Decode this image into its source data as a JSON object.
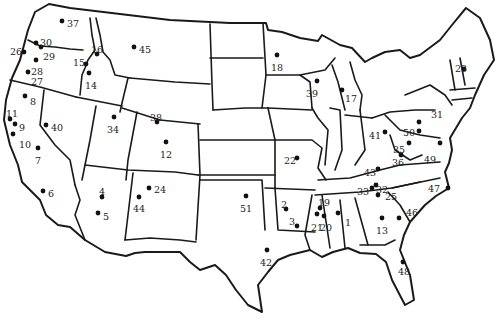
{
  "map": {
    "region": "Contiguous United States",
    "type": "point-location map with numbered sites",
    "colors": {
      "background": "#ffffff",
      "border": "#1a1a1a",
      "marker": "#111111",
      "label": "#222222"
    }
  },
  "sites": [
    {
      "id": "1",
      "x": 338,
      "y": 213,
      "lx": 345,
      "ly": 223
    },
    {
      "id": "2",
      "x": 286,
      "y": 209,
      "lx": 281,
      "ly": 205
    },
    {
      "id": "3",
      "x": 297,
      "y": 226,
      "lx": 289,
      "ly": 222
    },
    {
      "id": "4",
      "x": 102,
      "y": 197,
      "lx": 99,
      "ly": 192
    },
    {
      "id": "5",
      "x": 98,
      "y": 213,
      "lx": 103,
      "ly": 217
    },
    {
      "id": "6",
      "x": 43,
      "y": 191,
      "lx": 48,
      "ly": 194
    },
    {
      "id": "7",
      "x": 38,
      "y": 148,
      "lx": 35,
      "ly": 161
    },
    {
      "id": "8",
      "x": 25,
      "y": 96,
      "lx": 30,
      "ly": 102
    },
    {
      "id": "9",
      "x": 15,
      "y": 124,
      "lx": 19,
      "ly": 128
    },
    {
      "id": "10",
      "x": 13,
      "y": 134,
      "lx": 19,
      "ly": 145
    },
    {
      "id": "11",
      "x": 10,
      "y": 119,
      "lx": 6,
      "ly": 114
    },
    {
      "id": "12",
      "x": 166,
      "y": 142,
      "lx": 160,
      "ly": 155
    },
    {
      "id": "13",
      "x": 382,
      "y": 218,
      "lx": 376,
      "ly": 231
    },
    {
      "id": "14",
      "x": 89,
      "y": 73,
      "lx": 85,
      "ly": 86
    },
    {
      "id": "15",
      "x": 86,
      "y": 64,
      "lx": 73,
      "ly": 63
    },
    {
      "id": "16",
      "x": 97,
      "y": 54,
      "lx": 91,
      "ly": 50
    },
    {
      "id": "17",
      "x": 342,
      "y": 90,
      "lx": 345,
      "ly": 99
    },
    {
      "id": "18",
      "x": 277,
      "y": 55,
      "lx": 271,
      "ly": 68
    },
    {
      "id": "19",
      "x": 320,
      "y": 208,
      "lx": 318,
      "ly": 203
    },
    {
      "id": "20",
      "x": 324,
      "y": 216,
      "lx": 320,
      "ly": 228
    },
    {
      "id": "21",
      "x": 317,
      "y": 214,
      "lx": 311,
      "ly": 228
    },
    {
      "id": "22",
      "x": 297,
      "y": 158,
      "lx": 284,
      "ly": 161
    },
    {
      "id": "23",
      "x": 464,
      "y": 69,
      "lx": 455,
      "ly": 69
    },
    {
      "id": "24",
      "x": 149,
      "y": 188,
      "lx": 154,
      "ly": 190
    },
    {
      "id": "25",
      "x": 378,
      "y": 195,
      "lx": 385,
      "ly": 197
    },
    {
      "id": "26",
      "x": 24,
      "y": 52,
      "lx": 10,
      "ly": 52
    },
    {
      "id": "27",
      "x": 28,
      "y": 72,
      "lx": 31,
      "ly": 82
    },
    {
      "id": "28",
      "x": 36,
      "y": 60,
      "lx": 31,
      "ly": 72
    },
    {
      "id": "29",
      "x": 41,
      "y": 47,
      "lx": 43,
      "ly": 57
    },
    {
      "id": "30",
      "x": 36,
      "y": 43,
      "lx": 40,
      "ly": 43
    },
    {
      "id": "31",
      "x": 419,
      "y": 122,
      "lx": 431,
      "ly": 115
    },
    {
      "id": "32",
      "x": 376,
      "y": 185,
      "lx": 376,
      "ly": 190
    },
    {
      "id": "33",
      "x": 372,
      "y": 188,
      "lx": 357,
      "ly": 192
    },
    {
      "id": "34",
      "x": 114,
      "y": 117,
      "lx": 107,
      "ly": 130
    },
    {
      "id": "35",
      "x": 409,
      "y": 143,
      "lx": 393,
      "ly": 150
    },
    {
      "id": "36",
      "x": 401,
      "y": 155,
      "lx": 392,
      "ly": 163
    },
    {
      "id": "37",
      "x": 62,
      "y": 21,
      "lx": 67,
      "ly": 24
    },
    {
      "id": "38",
      "x": 157,
      "y": 122,
      "lx": 150,
      "ly": 118
    },
    {
      "id": "39",
      "x": 317,
      "y": 81,
      "lx": 306,
      "ly": 94
    },
    {
      "id": "40",
      "x": 46,
      "y": 125,
      "lx": 51,
      "ly": 128
    },
    {
      "id": "41",
      "x": 385,
      "y": 132,
      "lx": 369,
      "ly": 136
    },
    {
      "id": "42",
      "x": 267,
      "y": 250,
      "lx": 260,
      "ly": 263
    },
    {
      "id": "43",
      "x": 378,
      "y": 169,
      "lx": 364,
      "ly": 173
    },
    {
      "id": "44",
      "x": 139,
      "y": 197,
      "lx": 133,
      "ly": 209
    },
    {
      "id": "45",
      "x": 134,
      "y": 47,
      "lx": 139,
      "ly": 50
    },
    {
      "id": "46",
      "x": 399,
      "y": 218,
      "lx": 406,
      "ly": 213
    },
    {
      "id": "47",
      "x": 448,
      "y": 188,
      "lx": 428,
      "ly": 189
    },
    {
      "id": "48",
      "x": 403,
      "y": 262,
      "lx": 398,
      "ly": 272
    },
    {
      "id": "49",
      "x": 440,
      "y": 143,
      "lx": 424,
      "ly": 160
    },
    {
      "id": "50",
      "x": 419,
      "y": 131,
      "lx": 403,
      "ly": 133
    },
    {
      "id": "51",
      "x": 246,
      "y": 196,
      "lx": 240,
      "ly": 209
    }
  ]
}
